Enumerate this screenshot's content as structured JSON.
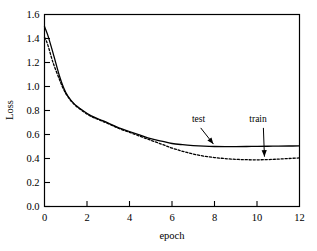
{
  "chart_data": {
    "type": "line",
    "title": "",
    "subtitle": "",
    "xlabel": "epoch",
    "ylabel": "Loss",
    "xlim": [
      0,
      12
    ],
    "ylim": [
      0.0,
      1.6
    ],
    "xticks": [
      "0",
      "2",
      "4",
      "6",
      "8",
      "10",
      "12"
    ],
    "xtick_values": [
      0,
      2,
      4,
      6,
      8,
      10,
      12
    ],
    "yticks": [
      "0.0",
      "0.2",
      "0.4",
      "0.6",
      "0.8",
      "1.0",
      "1.2",
      "1.4",
      "1.6"
    ],
    "ytick_values": [
      0.0,
      0.2,
      0.4,
      0.6,
      0.8,
      1.0,
      1.2,
      1.4,
      1.6
    ],
    "grid": false,
    "legend_position": "inline-annotations",
    "line_color": "#000000",
    "background_color": "#ffffff",
    "frame_color": "#000000",
    "series": [
      {
        "name": "test",
        "style": "solid",
        "x": [
          0.0,
          0.15,
          0.4,
          0.7,
          0.9,
          1.1,
          1.4,
          1.8,
          2.2,
          2.6,
          3.0,
          3.5,
          4.0,
          4.5,
          5.0,
          5.5,
          6.0,
          6.5,
          7.0,
          7.5,
          8.0,
          8.5,
          9.0,
          9.5,
          10.0,
          10.5,
          11.0,
          11.5,
          12.0
        ],
        "values": [
          1.5,
          1.43,
          1.28,
          1.09,
          0.99,
          0.92,
          0.855,
          0.8,
          0.755,
          0.725,
          0.695,
          0.655,
          0.625,
          0.595,
          0.565,
          0.545,
          0.525,
          0.515,
          0.508,
          0.503,
          0.5,
          0.499,
          0.499,
          0.5,
          0.501,
          0.502,
          0.503,
          0.504,
          0.505
        ]
      },
      {
        "name": "train",
        "style": "dashed",
        "x": [
          0.0,
          0.15,
          0.4,
          0.7,
          0.9,
          1.1,
          1.4,
          1.8,
          2.2,
          2.6,
          3.0,
          3.5,
          4.0,
          4.5,
          5.0,
          5.5,
          6.0,
          6.5,
          7.0,
          7.5,
          8.0,
          8.5,
          9.0,
          9.5,
          10.0,
          10.5,
          11.0,
          11.5,
          12.0
        ],
        "values": [
          1.41,
          1.35,
          1.2,
          1.06,
          0.975,
          0.915,
          0.85,
          0.795,
          0.75,
          0.72,
          0.69,
          0.65,
          0.618,
          0.585,
          0.552,
          0.52,
          0.487,
          0.46,
          0.437,
          0.42,
          0.408,
          0.399,
          0.393,
          0.39,
          0.389,
          0.391,
          0.395,
          0.4,
          0.405
        ]
      }
    ],
    "annotations": [
      {
        "name": "test",
        "label": "test",
        "label_x": 7.25,
        "label_y": 0.705,
        "arrow_from_x": 7.35,
        "arrow_from_y": 0.655,
        "arrow_to_x": 7.95,
        "arrow_to_y": 0.52
      },
      {
        "name": "train",
        "label": "train",
        "label_x": 10.05,
        "label_y": 0.705,
        "arrow_from_x": 10.3,
        "arrow_from_y": 0.655,
        "arrow_to_x": 10.35,
        "arrow_to_y": 0.415
      }
    ]
  }
}
